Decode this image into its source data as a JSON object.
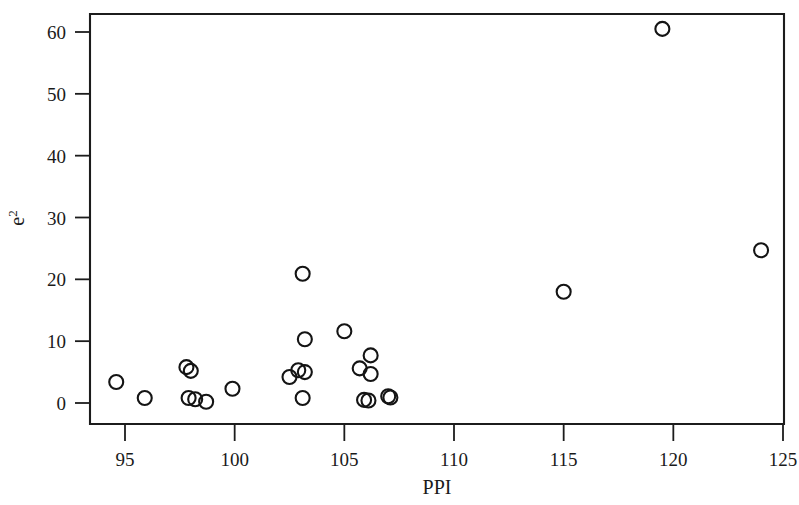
{
  "chart_data": {
    "type": "scatter",
    "title": "",
    "subtitle": "",
    "xlabel": "PPI",
    "ylabel": "e",
    "ylabel_superscript": "2",
    "xlim": [
      93.0,
      125.0
    ],
    "ylim": [
      -2.5,
      62.5
    ],
    "xticks": [
      95,
      100,
      105,
      110,
      115,
      120,
      125
    ],
    "xtick_labels": [
      "95",
      "100",
      "105",
      "110",
      "115",
      "120",
      "125"
    ],
    "yticks": [
      0,
      10,
      20,
      30,
      40,
      50,
      60
    ],
    "ytick_labels": [
      "0",
      "10",
      "20",
      "30",
      "40",
      "50",
      "60"
    ],
    "grid": false,
    "legend": null,
    "legend_position": "none",
    "marker": "open-circle",
    "marker_color": "#141414",
    "marker_size": 7,
    "n_points": 28,
    "annotations": [],
    "points": [
      {
        "x": 94.6,
        "y": 3.4
      },
      {
        "x": 95.9,
        "y": 0.8
      },
      {
        "x": 97.8,
        "y": 5.8
      },
      {
        "x": 98.0,
        "y": 5.2
      },
      {
        "x": 97.9,
        "y": 0.8
      },
      {
        "x": 98.2,
        "y": 0.6
      },
      {
        "x": 98.7,
        "y": 0.2
      },
      {
        "x": 99.9,
        "y": 2.3
      },
      {
        "x": 102.5,
        "y": 4.2
      },
      {
        "x": 102.9,
        "y": 5.3
      },
      {
        "x": 103.1,
        "y": 20.9
      },
      {
        "x": 103.2,
        "y": 10.3
      },
      {
        "x": 103.2,
        "y": 5.0
      },
      {
        "x": 103.1,
        "y": 0.8
      },
      {
        "x": 105.0,
        "y": 11.6
      },
      {
        "x": 105.7,
        "y": 5.6
      },
      {
        "x": 106.2,
        "y": 7.7
      },
      {
        "x": 106.2,
        "y": 4.7
      },
      {
        "x": 105.9,
        "y": 0.5
      },
      {
        "x": 106.1,
        "y": 0.4
      },
      {
        "x": 107.0,
        "y": 1.1
      },
      {
        "x": 107.1,
        "y": 0.9
      },
      {
        "x": 115.0,
        "y": 18.0
      },
      {
        "x": 119.5,
        "y": 60.5
      },
      {
        "x": 124.0,
        "y": 24.7
      }
    ]
  },
  "axes": {
    "x_axis_name": "ppi-axis",
    "y_axis_name": "e-squared-axis"
  }
}
